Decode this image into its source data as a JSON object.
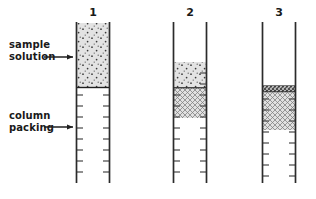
{
  "figure": {
    "background_color": "#ffffff",
    "line_color": "#2b2b2b",
    "width": 316,
    "height": 199
  },
  "annotations": [
    {
      "id": "sample-solution",
      "line1": "sample",
      "line2": "solution",
      "text_x": 9,
      "text_y_line1": 48,
      "text_y_line2": 60,
      "arrow_x1": 44,
      "arrow_x2": 73,
      "arrow_y": 57,
      "points_to": "column-1-sample-band"
    },
    {
      "id": "column-packing",
      "line1": "column",
      "line2": "packing",
      "text_x": 9,
      "text_y_line1": 119,
      "text_y_line2": 131,
      "arrow_x1": 44,
      "arrow_x2": 73,
      "arrow_y": 127,
      "points_to": "column-1-packing-region"
    }
  ],
  "columns": [
    {
      "label": "1",
      "label_x": 93,
      "label_y": 16,
      "left_wall_x": 76,
      "right_wall_x": 110,
      "top_y": 22,
      "bottom_y": 183,
      "bands": [
        {
          "name": "sample-band",
          "fill": "dots",
          "top_y": 23,
          "bottom_y": 87,
          "has_bottom_rule": true,
          "has_top_rule": false
        }
      ],
      "packing_top_y": 89,
      "packing_bottom_y": 183
    },
    {
      "label": "2",
      "label_x": 190,
      "label_y": 16,
      "left_wall_x": 173,
      "right_wall_x": 207,
      "top_y": 22,
      "bottom_y": 183,
      "bands": [
        {
          "name": "sample-band",
          "fill": "dots",
          "top_y": 62,
          "bottom_y": 88,
          "has_bottom_rule": true,
          "has_top_rule": false
        },
        {
          "name": "separated-band",
          "fill": "hatch",
          "top_y": 88,
          "bottom_y": 118,
          "has_bottom_rule": false,
          "has_top_rule": false
        }
      ],
      "packing_top_y": 62,
      "packing_bottom_y": 183
    },
    {
      "label": "3",
      "label_x": 279,
      "label_y": 16,
      "left_wall_x": 262,
      "right_wall_x": 296,
      "top_y": 22,
      "bottom_y": 183,
      "bands": [
        {
          "name": "sample-band",
          "fill": "dense-dots",
          "top_y": 86,
          "bottom_y": 92,
          "has_bottom_rule": true,
          "has_top_rule": true
        },
        {
          "name": "separated-band",
          "fill": "hatch",
          "top_y": 92,
          "bottom_y": 130,
          "has_bottom_rule": false,
          "has_top_rule": false
        }
      ],
      "packing_top_y": 86,
      "packing_bottom_y": 183
    }
  ],
  "tick_marks": {
    "description": "short horizontal dashes on the inner face of each column wall indicating packing material",
    "length": 6,
    "spacing": 11.5,
    "start_offset": 6
  }
}
